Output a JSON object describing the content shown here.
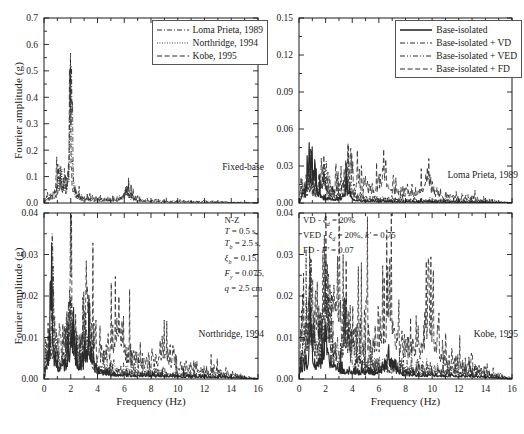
{
  "figure": {
    "width": 518,
    "height": 434,
    "axis_color": "#1a1a1a",
    "background": "#ffffff"
  },
  "axis_titles": {
    "y": "Fourier amplitude (g)",
    "x": "Frequency (Hz)"
  },
  "legends": {
    "records": {
      "items": [
        {
          "label": "Loma Prieta, 1989",
          "style": "dash-dot"
        },
        {
          "label": "Northridge, 1994",
          "style": "dotted"
        },
        {
          "label": "Kobe, 1995",
          "style": "dashed"
        }
      ]
    },
    "systems": {
      "items": [
        {
          "label": "Base-isolated",
          "style": "solid"
        },
        {
          "label": "Base-isolated + VD",
          "style": "dash-dot"
        },
        {
          "label": "Base-isolated + VED",
          "style": "dash-dot-dot"
        },
        {
          "label": "Base-isolated + FD",
          "style": "dashed"
        }
      ]
    }
  },
  "annotations": {
    "isolator": [
      "N-Z",
      "T = 0.5 s,",
      "Tb = 2.5 s,",
      "ξbb = 0.15,",
      "Fy = 0.075,",
      "q = 2.5 cm"
    ],
    "dampers": [
      "VD - ξd = 20%",
      "VED - ξd = 20%, k' = 0.75",
      "FD - F' = 0.07"
    ]
  },
  "chart_data": [
    {
      "id": "fixed-base",
      "type": "line",
      "title": "Fixed-base",
      "panel_label": "Fixed-base",
      "xlabel": "Frequency (Hz)",
      "ylabel": "Fourier amplitude (g)",
      "xlim": [
        0,
        16
      ],
      "ylim": [
        0,
        0.7
      ],
      "xticks": [
        0,
        2,
        4,
        6,
        8,
        10,
        12,
        14,
        16
      ],
      "xticklabels": [
        "0",
        "2",
        "4",
        "6",
        "8",
        "10",
        "12",
        "14",
        "16"
      ],
      "yticks": [
        0.0,
        0.1,
        0.2,
        0.3,
        0.4,
        0.5,
        0.6,
        0.7
      ],
      "yticklabels": [
        "0.0",
        "0.1",
        "0.2",
        "0.3",
        "0.4",
        "0.5",
        "0.6",
        "0.7"
      ],
      "grid": false,
      "legend": "records",
      "legend_position": "top-right",
      "series": [
        {
          "name": "Loma Prieta, 1989",
          "style": "dash-dot",
          "peak_frequency": 2.0,
          "peak_value": 0.66,
          "secondary_peaks": [
            {
              "frequency": 1.3,
              "value": 0.12
            },
            {
              "frequency": 6.2,
              "value": 0.055
            }
          ],
          "baseline": 0.008
        },
        {
          "name": "Northridge, 1994",
          "style": "dotted",
          "peak_frequency": 2.0,
          "peak_value": 0.5,
          "secondary_peaks": [
            {
              "frequency": 1.2,
              "value": 0.1
            },
            {
              "frequency": 6.2,
              "value": 0.04
            }
          ],
          "baseline": 0.007
        },
        {
          "name": "Kobe, 1995",
          "style": "dashed",
          "peak_frequency": 1.95,
          "peak_value": 0.42,
          "secondary_peaks": [
            {
              "frequency": 1.1,
              "value": 0.14
            },
            {
              "frequency": 6.3,
              "value": 0.05
            }
          ],
          "baseline": 0.01
        }
      ]
    },
    {
      "id": "loma-prieta",
      "type": "line",
      "title": "Loma Prieta, 1989",
      "panel_label": "Loma Prieta, 1989",
      "xlabel": "Frequency (Hz)",
      "ylabel": "Fourier amplitude (g)",
      "xlim": [
        0,
        16
      ],
      "ylim": [
        0,
        0.15
      ],
      "xticks": [
        0,
        2,
        4,
        6,
        8,
        10,
        12,
        14,
        16
      ],
      "xticklabels": [
        "0",
        "2",
        "4",
        "6",
        "8",
        "10",
        "12",
        "14",
        "16"
      ],
      "yticks": [
        0.0,
        0.03,
        0.06,
        0.09,
        0.12,
        0.15
      ],
      "yticklabels": [
        "0.00",
        "0.03",
        "0.06",
        "0.09",
        "0.12",
        "0.15"
      ],
      "grid": false,
      "legend": "systems",
      "legend_position": "top-right",
      "series": [
        {
          "name": "Base-isolated",
          "style": "solid",
          "peak_frequency": 0.75,
          "peak_value": 0.057,
          "secondary_peaks": [
            {
              "frequency": 1.1,
              "value": 0.03
            },
            {
              "frequency": 3.6,
              "value": 0.012
            }
          ],
          "baseline": 0.002
        },
        {
          "name": "Base-isolated + VD",
          "style": "dash-dot",
          "peak_frequency": 0.8,
          "peak_value": 0.03,
          "secondary_peaks": [
            {
              "frequency": 1.8,
              "value": 0.022
            },
            {
              "frequency": 3.6,
              "value": 0.02
            }
          ],
          "baseline": 0.004
        },
        {
          "name": "Base-isolated + VED",
          "style": "dash-dot-dot",
          "peak_frequency": 0.85,
          "peak_value": 0.028,
          "secondary_peaks": [
            {
              "frequency": 1.9,
              "value": 0.025
            },
            {
              "frequency": 3.7,
              "value": 0.022
            }
          ],
          "baseline": 0.005
        },
        {
          "name": "Base-isolated + FD",
          "style": "dashed",
          "peak_frequency": 1.7,
          "peak_value": 0.034,
          "secondary_peaks": [
            {
              "frequency": 3.7,
              "value": 0.03
            },
            {
              "frequency": 6.4,
              "value": 0.026
            },
            {
              "frequency": 9.6,
              "value": 0.02
            }
          ],
          "baseline": 0.008
        }
      ]
    },
    {
      "id": "northridge",
      "type": "line",
      "title": "Northridge, 1994",
      "panel_label": "Northridge, 1994",
      "xlabel": "Frequency (Hz)",
      "ylabel": "Fourier amplitude (g)",
      "xlim": [
        0,
        16
      ],
      "ylim": [
        0,
        0.04
      ],
      "xticks": [
        0,
        2,
        4,
        6,
        8,
        10,
        12,
        14,
        16
      ],
      "xticklabels": [
        "0",
        "2",
        "4",
        "6",
        "8",
        "10",
        "12",
        "14",
        "16"
      ],
      "yticks": [
        0.0,
        0.01,
        0.02,
        0.03,
        0.04
      ],
      "yticklabels": [
        "0.00",
        "0.01",
        "0.02",
        "0.03",
        "0.04"
      ],
      "grid": false,
      "legend": null,
      "annotation": "isolator",
      "series": [
        {
          "name": "Base-isolated",
          "style": "solid",
          "peak_frequency": 0.55,
          "peak_value": 0.028,
          "secondary_peaks": [
            {
              "frequency": 2.1,
              "value": 0.012
            },
            {
              "frequency": 3.3,
              "value": 0.008
            }
          ],
          "baseline": 0.0015
        },
        {
          "name": "Base-isolated + VD",
          "style": "dash-dot",
          "peak_frequency": 0.6,
          "peak_value": 0.029,
          "secondary_peaks": [
            {
              "frequency": 2.0,
              "value": 0.015
            },
            {
              "frequency": 3.2,
              "value": 0.009
            }
          ],
          "baseline": 0.002
        },
        {
          "name": "Base-isolated + VED",
          "style": "dash-dot-dot",
          "peak_frequency": 0.6,
          "peak_value": 0.027,
          "secondary_peaks": [
            {
              "frequency": 2.0,
              "value": 0.016
            },
            {
              "frequency": 3.3,
              "value": 0.012
            }
          ],
          "baseline": 0.003
        },
        {
          "name": "Base-isolated + FD",
          "style": "dashed",
          "peak_frequency": 2.0,
          "peak_value": 0.029,
          "secondary_peaks": [
            {
              "frequency": 3.3,
              "value": 0.014
            },
            {
              "frequency": 5.5,
              "value": 0.016
            },
            {
              "frequency": 9.0,
              "value": 0.007
            }
          ],
          "baseline": 0.004
        }
      ]
    },
    {
      "id": "kobe",
      "type": "line",
      "title": "Kobe, 1995",
      "panel_label": "Kobe, 1995",
      "xlabel": "Frequency (Hz)",
      "ylabel": "Fourier amplitude (g)",
      "xlim": [
        0,
        16
      ],
      "ylim": [
        0,
        0.04
      ],
      "xticks": [
        0,
        2,
        4,
        6,
        8,
        10,
        12,
        14,
        16
      ],
      "xticklabels": [
        "0",
        "2",
        "4",
        "6",
        "8",
        "10",
        "12",
        "14",
        "16"
      ],
      "yticks": [
        0.0,
        0.01,
        0.02,
        0.03,
        0.04
      ],
      "yticklabels": [
        "0.00",
        "0.01",
        "0.02",
        "0.03",
        "0.04"
      ],
      "grid": false,
      "legend": null,
      "annotation": "dampers",
      "series": [
        {
          "name": "Base-isolated",
          "style": "solid",
          "peak_frequency": 0.9,
          "peak_value": 0.016,
          "secondary_peaks": [
            {
              "frequency": 2.0,
              "value": 0.01
            },
            {
              "frequency": 6.8,
              "value": 0.005
            }
          ],
          "baseline": 0.002
        },
        {
          "name": "Base-isolated + VD",
          "style": "dash-dot",
          "peak_frequency": 0.85,
          "peak_value": 0.028,
          "secondary_peaks": [
            {
              "frequency": 2.0,
              "value": 0.018
            },
            {
              "frequency": 3.5,
              "value": 0.012
            }
          ],
          "baseline": 0.004
        },
        {
          "name": "Base-isolated + VED",
          "style": "dash-dot-dot",
          "peak_frequency": 0.9,
          "peak_value": 0.027,
          "secondary_peaks": [
            {
              "frequency": 2.1,
              "value": 0.02
            },
            {
              "frequency": 3.6,
              "value": 0.014
            }
          ],
          "baseline": 0.005
        },
        {
          "name": "Base-isolated + FD",
          "style": "dashed",
          "peak_frequency": 2.0,
          "peak_value": 0.029,
          "secondary_peaks": [
            {
              "frequency": 2.8,
              "value": 0.024
            },
            {
              "frequency": 6.8,
              "value": 0.021
            },
            {
              "frequency": 9.8,
              "value": 0.018
            }
          ],
          "baseline": 0.007
        }
      ]
    }
  ]
}
